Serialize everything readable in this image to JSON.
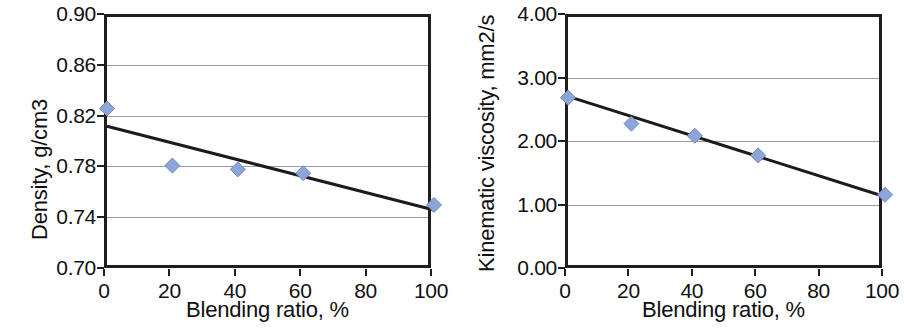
{
  "figure": {
    "background_color": "#ffffff",
    "panel_count": 2
  },
  "style": {
    "marker_fill": "#8ea5d8",
    "marker_edge": "#6f86c4",
    "trendline_color": "#1d1a1b",
    "axis_color": "#211d1e",
    "gridline_color": "#9b9b9b"
  },
  "chart_data": [
    {
      "type": "scatter",
      "title": "",
      "xlabel": "Blending ratio, %",
      "ylabel": "Density, g/cm3",
      "xlim": [
        0,
        100
      ],
      "ylim": [
        0.7,
        0.9
      ],
      "xticks": [
        "0",
        "20",
        "40",
        "60",
        "80",
        "100"
      ],
      "xtick_values": [
        0,
        20,
        40,
        60,
        80,
        100
      ],
      "yticks": [
        "0.70",
        "0.74",
        "0.78",
        "0.82",
        "0.86",
        "0.90"
      ],
      "ytick_values": [
        0.7,
        0.74,
        0.78,
        0.82,
        0.86,
        0.9
      ],
      "grid": true,
      "grid_axis": "y",
      "gridline_values": [
        0.74,
        0.78,
        0.82,
        0.86
      ],
      "legend": null,
      "series": [
        {
          "name": "Density measurements",
          "marker": "diamond",
          "x": [
            0,
            20,
            40,
            60,
            100
          ],
          "values": [
            0.828,
            0.783,
            0.78,
            0.777,
            0.752
          ]
        },
        {
          "name": "Linear trendline",
          "type": "line",
          "x": [
            0,
            100
          ],
          "values": [
            0.814,
            0.748
          ]
        }
      ]
    },
    {
      "type": "scatter",
      "title": "",
      "xlabel": "Blending ratio, %",
      "ylabel": "Kinematic viscosity, mm2/s",
      "xlim": [
        0,
        100
      ],
      "ylim": [
        0.0,
        4.0
      ],
      "xticks": [
        "0",
        "20",
        "40",
        "60",
        "80",
        "100"
      ],
      "xtick_values": [
        0,
        20,
        40,
        60,
        80,
        100
      ],
      "yticks": [
        "0.00",
        "1.00",
        "2.00",
        "3.00",
        "4.00"
      ],
      "ytick_values": [
        0.0,
        1.0,
        2.0,
        3.0,
        4.0
      ],
      "grid": true,
      "grid_axis": "y",
      "gridline_values": [
        1.0,
        2.0,
        3.0
      ],
      "legend": null,
      "series": [
        {
          "name": "Kinematic viscosity measurements",
          "marker": "diamond",
          "x": [
            0,
            20,
            40,
            60,
            100
          ],
          "values": [
            2.73,
            2.32,
            2.13,
            1.82,
            1.2
          ]
        },
        {
          "name": "Linear trendline",
          "type": "line",
          "x": [
            0,
            100
          ],
          "values": [
            2.75,
            1.17
          ]
        }
      ]
    }
  ]
}
